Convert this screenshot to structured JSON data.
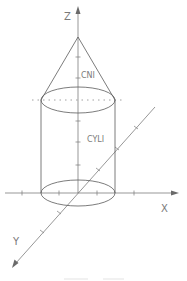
{
  "diagram": {
    "type": "3d-solid-wireframe",
    "axes": {
      "x_label": "X",
      "y_label": "Y",
      "z_label": "Z"
    },
    "solids": [
      {
        "label": "CNI",
        "shape": "cone"
      },
      {
        "label": "CYLI",
        "shape": "cylinder"
      }
    ],
    "colors": {
      "background": "#ffffff",
      "line": "#5a5a5a",
      "text": "#7a7a7a"
    }
  }
}
